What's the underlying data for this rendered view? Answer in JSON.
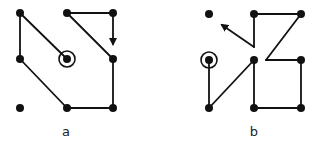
{
  "diagrams": [
    {
      "id": "a",
      "label": "a",
      "label_pos": [
        66,
        124
      ],
      "dots": [
        [
          20,
          13
        ],
        [
          67,
          13
        ],
        [
          113,
          13
        ],
        [
          20,
          59
        ],
        [
          67,
          59
        ],
        [
          113,
          59
        ],
        [
          20,
          108
        ],
        [
          67,
          108
        ],
        [
          113,
          108
        ]
      ],
      "start": [
        67,
        59
      ],
      "path_segments": [
        [
          [
            67,
            59
          ],
          [
            20,
            13
          ]
        ],
        [
          [
            20,
            13
          ],
          [
            20,
            59
          ]
        ],
        [
          [
            20,
            59
          ],
          [
            67,
            108
          ]
        ],
        [
          [
            67,
            108
          ],
          [
            113,
            108
          ]
        ],
        [
          [
            113,
            108
          ],
          [
            113,
            59
          ]
        ],
        [
          [
            113,
            59
          ],
          [
            67,
            13
          ]
        ],
        [
          [
            67,
            13
          ],
          [
            113,
            13
          ]
        ],
        [
          [
            113,
            13
          ],
          [
            113,
            44
          ]
        ]
      ],
      "arrow_end": [
        113,
        44
      ]
    },
    {
      "id": "b",
      "label": "b",
      "label_pos": [
        254,
        124
      ],
      "dots": [
        [
          209,
          14
        ],
        [
          254,
          14
        ],
        [
          301,
          14
        ],
        [
          209,
          60
        ],
        [
          254,
          60
        ],
        [
          301,
          60
        ],
        [
          209,
          108
        ],
        [
          254,
          108
        ],
        [
          301,
          108
        ]
      ],
      "start": [
        209,
        60
      ],
      "path_segments": [
        [
          [
            209,
            60
          ],
          [
            209,
            108
          ]
        ],
        [
          [
            209,
            108
          ],
          [
            254,
            60
          ]
        ],
        [
          [
            254,
            60
          ],
          [
            254,
            108
          ]
        ],
        [
          [
            254,
            108
          ],
          [
            301,
            108
          ]
        ],
        [
          [
            301,
            108
          ],
          [
            301,
            60
          ]
        ],
        [
          [
            301,
            60
          ],
          [
            266,
            60
          ]
        ],
        [
          [
            266,
            60
          ],
          [
            301,
            14
          ]
        ],
        [
          [
            301,
            14
          ],
          [
            254,
            14
          ]
        ],
        [
          [
            254,
            14
          ],
          [
            254,
            47
          ]
        ],
        [
          [
            254,
            47
          ],
          [
            222,
            25
          ]
        ]
      ],
      "arrow_end": [
        222,
        25
      ]
    }
  ],
  "colors": {
    "ink": "#111111",
    "background": "#ffffff"
  }
}
